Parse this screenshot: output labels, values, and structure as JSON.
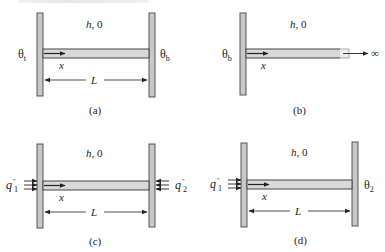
{
  "figure": {
    "panels": [
      {
        "id": "a",
        "caption": "(a)",
        "convection_label_h": "h",
        "convection_label_theta": "0",
        "left_label": "θ",
        "left_label_sub": "t",
        "right_label": "θ",
        "right_label_sub": "b",
        "axis_label": "x",
        "length_label": "L"
      },
      {
        "id": "b",
        "caption": "(b)",
        "convection_label_h": "h",
        "convection_label_theta": "0",
        "left_label": "θ",
        "left_label_sub": "b",
        "axis_label": "x",
        "end_label": "∞"
      },
      {
        "id": "c",
        "caption": "(c)",
        "convection_label_h": "h",
        "convection_label_theta": "0",
        "left_label": "q",
        "left_label_sup": "''",
        "left_label_sub": "1",
        "right_label": "q",
        "right_label_sup": "''",
        "right_label_sub": "2",
        "axis_label": "x",
        "length_label": "L"
      },
      {
        "id": "d",
        "caption": "(d)",
        "convection_label_h": "h",
        "convection_label_theta": "0",
        "left_label": "q",
        "left_label_sup": "''",
        "left_label_sub": "1",
        "right_label": "θ",
        "right_label_sub": "2",
        "axis_label": "x",
        "length_label": "L"
      }
    ],
    "colors": {
      "wall_fill": "#c8c8c8",
      "wall_stroke": "#555555",
      "fin_fill": "#d9d9d9",
      "fin_stroke": "#444444",
      "line": "#222222"
    }
  }
}
